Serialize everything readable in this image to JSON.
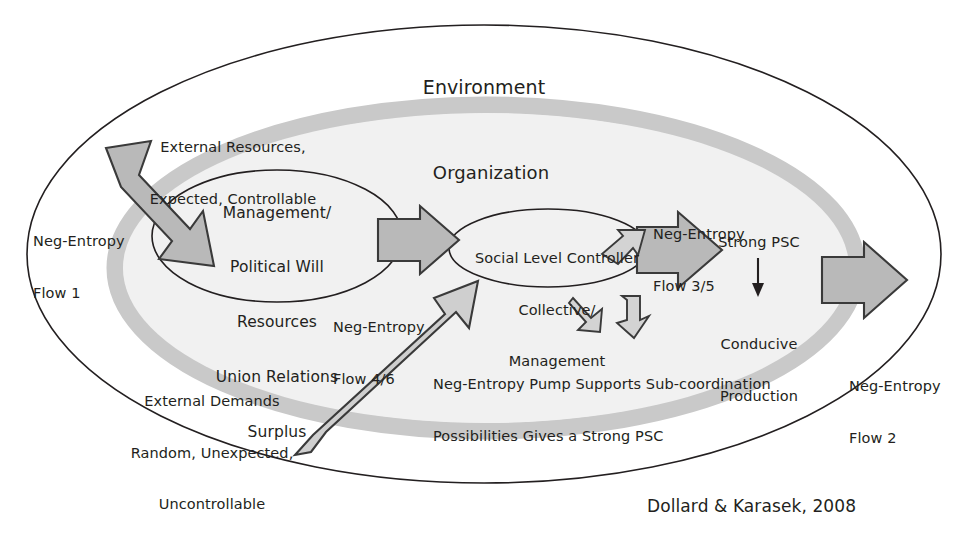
{
  "figure": {
    "credit": "Dollard & Karasek, 2008",
    "colors": {
      "outline": "#231f20",
      "arrow_fill": "#b9b9b9",
      "arrow_stroke": "#3a3a3a",
      "ring_gray": "#c9c9c9",
      "inner_fill": "#f1f1f1",
      "background": "#ffffff",
      "text": "#231f20"
    }
  },
  "containers": {
    "environment": {
      "label": "Environment"
    },
    "organization": {
      "label": "Organization"
    }
  },
  "nodes": {
    "management_oval": {
      "label": "Management/\nPolitical Will\nResources\nUnion Relations\nSurplus",
      "lines": [
        "Management/",
        "Political Will",
        "Resources",
        "Union Relations",
        "Surplus"
      ]
    },
    "social_level_controller_oval": {
      "label": "Social Level Controller\nCollective/\nManagement",
      "lines": [
        "Social Level Controller",
        "Collective/",
        "Management"
      ]
    },
    "strong_psc": {
      "label": "Strong PSC"
    },
    "conducive_production": {
      "label": "Conducive\nProduction",
      "lines": [
        "Conducive",
        "Production"
      ]
    }
  },
  "annotations": {
    "external_resources": {
      "label": "External Resources,\nExpected, Controllable",
      "lines": [
        "External Resources,",
        "Expected, Controllable"
      ]
    },
    "external_demands": {
      "label": "External Demands\nRandom, Unexpected,\nUncontrollable",
      "lines": [
        "External Demands",
        "Random, Unexpected,",
        "Uncontrollable"
      ]
    },
    "pump_note": {
      "label": "Neg-Entropy Pump Supports Sub-coordination\nPossibilities Gives a Strong PSC",
      "lines": [
        "Neg-Entropy Pump Supports Sub-coordination",
        "Possibilities Gives a Strong PSC"
      ]
    }
  },
  "flows": [
    {
      "id": "flow1",
      "label": "Neg-Entropy\nFlow 1",
      "lines": [
        "Neg-Entropy",
        "Flow 1"
      ]
    },
    {
      "id": "flow46",
      "label": "Neg-Entropy\nFlow 4/6",
      "lines": [
        "Neg-Entropy",
        "Flow 4/6"
      ]
    },
    {
      "id": "flow35",
      "label": "Neg-Entropy\nFlow 3/5",
      "lines": [
        "Neg-Entropy",
        "Flow 3/5"
      ]
    },
    {
      "id": "flow2",
      "label": "Neg-Entropy\nFlow 2",
      "lines": [
        "Neg-Entropy",
        "Flow 2"
      ]
    }
  ],
  "icons": {
    "arrow_in_resources": "arrow-down-right-icon",
    "arrow_in_demands": "arrow-up-right-icon",
    "arrow_mgmt_to_slc": "arrow-right-icon",
    "arrow_slc_out": "arrow-right-icon",
    "arrow_org_out": "arrow-right-icon",
    "arrow_pump_small_right": "curved-arrow-right-icon",
    "arrow_pump_small_upleft": "curved-arrow-up-left-icon",
    "arrow_pump_small_downright": "curved-arrow-down-right-icon",
    "arrow_psc_to_production": "arrow-down-thin-icon"
  }
}
